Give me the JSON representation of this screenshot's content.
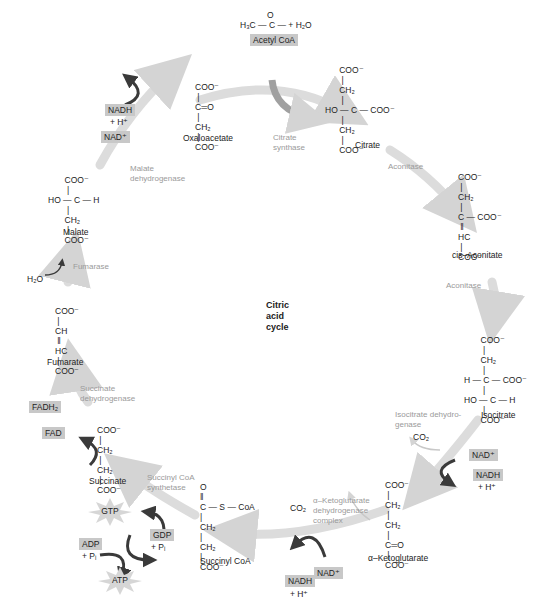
{
  "title": "Citric\nacid\ncycle",
  "colors": {
    "cycle_arrow": "#d9d9d9",
    "cofactor_arrow": "#3a3a3a",
    "cofactor_box": "#c8c8c8",
    "enzyme_text": "#9a9a9a",
    "text": "#222222"
  },
  "inputs": {
    "acetyl_formula": "H₃C — C — + H₂O",
    "acetyl_carbonyl": "O",
    "acetyl_label": "Acetyl CoA"
  },
  "molecules": [
    {
      "id": "citrate",
      "name": "Citrate",
      "lines": [
        "      COO⁻",
        "       |",
        "      CH₂",
        "       |",
        "HO — C — COO⁻",
        "       |",
        "      CH₂",
        "       |",
        "      COO⁻"
      ]
    },
    {
      "id": "cis-aconitate",
      "name": "cis–Aconitate",
      "lines": [
        "COO⁻",
        " |",
        "CH₂",
        " |",
        "C — COO⁻",
        " ‖",
        "HC",
        " |",
        "COO⁻"
      ]
    },
    {
      "id": "isocitrate",
      "name": "Isocitrate",
      "lines": [
        "       COO⁻",
        "        |",
        "       CH₂",
        "        |",
        "H — C — COO⁻",
        "        |",
        "HO — C — H",
        "        |",
        "       COO⁻"
      ]
    },
    {
      "id": "alpha-ketoglutarate",
      "name": "α–Ketoglutarate",
      "lines": [
        "COO⁻",
        " |",
        "CH₂",
        " |",
        "CH₂",
        " |",
        "C═O",
        " |",
        "COO⁻"
      ]
    },
    {
      "id": "succinyl-coa",
      "name": "Succinyl CoA",
      "lines": [
        "O",
        "‖",
        "C — S — CoA",
        "|",
        "CH₂",
        "|",
        "CH₂",
        "|",
        "COO⁻"
      ]
    },
    {
      "id": "succinate",
      "name": "Succinate",
      "lines": [
        "COO⁻",
        " |",
        "CH₂",
        " |",
        "CH₂",
        " |",
        "COO⁻"
      ]
    },
    {
      "id": "fumarate",
      "name": "Fumarate",
      "lines": [
        "COO⁻",
        " |",
        "CH",
        " ‖",
        "HC",
        " |",
        "COO⁻"
      ]
    },
    {
      "id": "malate",
      "name": "Malate",
      "lines": [
        "       COO⁻",
        "        |",
        "HO — C — H",
        "        |",
        "       CH₂",
        "        |",
        "       COO⁻"
      ]
    },
    {
      "id": "oxaloacetate",
      "name": "Oxaloacetate",
      "lines": [
        "COO⁻",
        " |",
        "C═O",
        " |",
        "CH₂",
        " |",
        "COO⁻"
      ]
    }
  ],
  "enzymes": {
    "citrate_synthase": "Citrate\nsynthase",
    "aconitase_1": "Aconitase",
    "aconitase_2": "Aconitase",
    "isocitrate_dh": "Isocitrate dehydro-\ngenase",
    "akg_dh": "α–Ketoglutarate\ndehydrogenase\ncomplex",
    "succinyl_coa_synthetase": "Succinyl CoA\nsynthetase",
    "succinate_dh": "Succinate\ndehydrogenase",
    "fumarase": "Fumarase",
    "malate_dh": "Malate\ndehydrogenase"
  },
  "cofactors": {
    "isocitrate": {
      "co2": "CO₂",
      "in": "NAD⁺",
      "out": "NADH",
      "h": "+ H⁺"
    },
    "akg": {
      "co2": "CO₂",
      "in": "NAD⁺",
      "out": "NADH",
      "h": "+ H⁺"
    },
    "succinyl": {
      "gtp": "GTP",
      "gdp": "GDP",
      "gdp_pi": "+ Pᵢ",
      "adp": "ADP",
      "adp_pi": "+ Pᵢ",
      "atp": "ATP"
    },
    "succinate": {
      "in": "FAD",
      "out": "FADH₂"
    },
    "fumarase": {
      "in": "H₂O"
    },
    "malate": {
      "in": "NAD⁺",
      "out": "NADH",
      "h": "+ H⁺"
    }
  }
}
